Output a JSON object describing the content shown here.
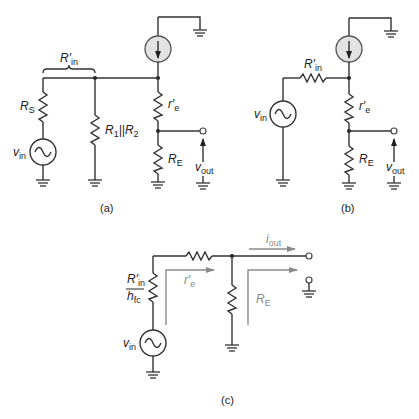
{
  "figure": {
    "panels": [
      {
        "id": "a",
        "caption": "(a)",
        "labels": {
          "rin_prime": "R′",
          "rin_sub": "in",
          "rs": "R",
          "rs_sub": "S",
          "vin": "v",
          "vin_sub": "in",
          "r1r2": "R",
          "r1r2_sub1": "1",
          "r1r2_mid": "||R",
          "r1r2_sub2": "2",
          "re_prime": "r′",
          "re_prime_sub": "e",
          "RE": "R",
          "RE_sub": "E",
          "vout": "v",
          "vout_sub": "out"
        }
      },
      {
        "id": "b",
        "caption": "(b)",
        "labels": {
          "rin_prime": "R′",
          "rin_sub": "in",
          "vin": "v",
          "vin_sub": "in",
          "re_prime": "r′",
          "re_prime_sub": "e",
          "RE": "R",
          "RE_sub": "E",
          "vout": "v",
          "vout_sub": "out"
        }
      },
      {
        "id": "c",
        "caption": "(c)",
        "labels": {
          "frac_num": "R′",
          "frac_num_sub": "in",
          "frac_den": "h",
          "frac_den_sub": "fc",
          "vin": "v",
          "vin_sub": "in",
          "iout": "i",
          "iout_sub": "out",
          "re_prime": "r′",
          "re_prime_sub": "e",
          "RE": "R",
          "RE_sub": "E"
        }
      }
    ],
    "colors": {
      "wire": "#333333",
      "current_source_fill": "#e2e2e2",
      "annotation_grey": "#8a8a8a"
    }
  }
}
